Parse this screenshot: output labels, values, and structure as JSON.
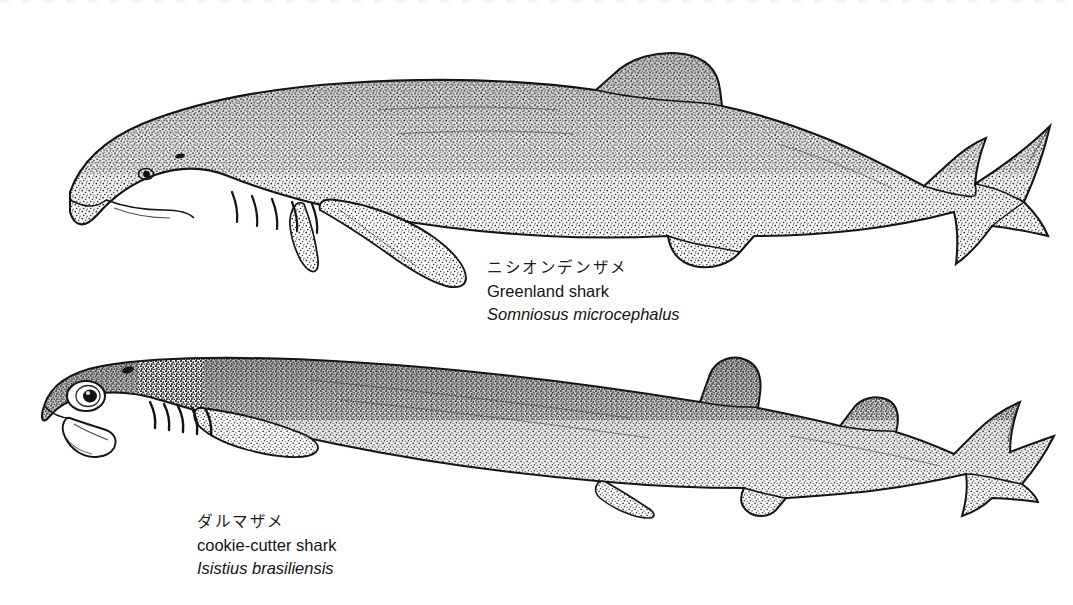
{
  "plate": {
    "background_color": "#ffffff",
    "ink_color": "#1a1a1a",
    "style": "stippled pen-and-ink scientific illustration",
    "panel_count": 2
  },
  "figures": [
    {
      "id": "greenland-shark",
      "order": 1,
      "caption": {
        "japanese": "ニシオンデンザメ",
        "common_name": "Greenland shark",
        "scientific_name": "Somniosus microcephalus"
      },
      "features": {
        "body": "stout cylindrical body, blunt rounded snout",
        "eye": "small",
        "gill_slits": 5,
        "dorsal_fins": 2,
        "caudal_fin": "asymmetric heterocercal with notched trailing edge",
        "orientation": "left-facing lateral view"
      }
    },
    {
      "id": "cookie-cutter-shark",
      "order": 2,
      "caption": {
        "japanese": "ダルマザメ",
        "common_name": "cookie-cutter shark",
        "scientific_name": "Isistius brasiliensis"
      },
      "features": {
        "body": "cigar-shaped body with dark collar band behind head",
        "eye": "large and prominent",
        "gill_slits": 5,
        "mouth": "open suctorial mouth",
        "dorsal_fins": 2,
        "caudal_fin": "broad near-symmetrical paddle",
        "orientation": "left-facing lateral view"
      }
    }
  ]
}
